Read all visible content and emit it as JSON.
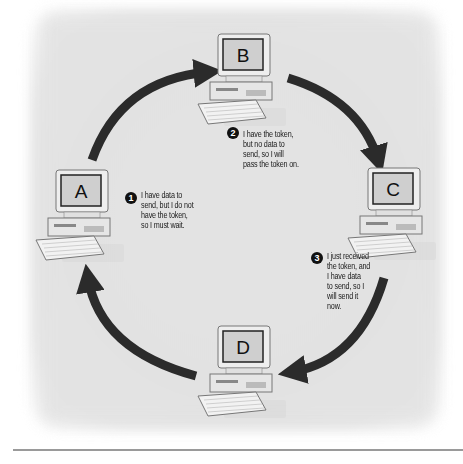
{
  "diagram": {
    "colors": {
      "background": "#e3e3e3",
      "arrow": "#2b2b2b",
      "screen": "#cfcfcf",
      "case": "#e8e8e8",
      "rule": "#9a9a9a"
    },
    "nodes": [
      {
        "id": "A",
        "label": "A",
        "icon": "computer-icon"
      },
      {
        "id": "B",
        "label": "B",
        "icon": "computer-icon"
      },
      {
        "id": "C",
        "label": "C",
        "icon": "computer-icon"
      },
      {
        "id": "D",
        "label": "D",
        "icon": "computer-icon"
      }
    ],
    "edges": [
      {
        "from": "A",
        "to": "B"
      },
      {
        "from": "B",
        "to": "C"
      },
      {
        "from": "C",
        "to": "D"
      },
      {
        "from": "D",
        "to": "A"
      }
    ],
    "notes": [
      {
        "step": "1",
        "node": "A",
        "lines": [
          "I have data to",
          "send, but I do not",
          "have the token,",
          "so I must wait."
        ]
      },
      {
        "step": "2",
        "node": "B",
        "lines": [
          "I have the token,",
          "but no data to",
          "send, so I will",
          "pass the token on."
        ]
      },
      {
        "step": "3",
        "node": "C",
        "lines": [
          "I just received",
          "the token, and",
          "I have data",
          "to send, so I",
          "will send it",
          "now."
        ]
      }
    ]
  }
}
